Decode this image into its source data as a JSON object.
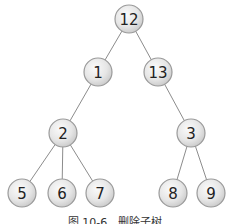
{
  "diagram": {
    "type": "tree",
    "nodes": [
      {
        "id": "n12",
        "label": "12",
        "x": 129,
        "y": 19
      },
      {
        "id": "n1",
        "label": "1",
        "x": 98,
        "y": 72
      },
      {
        "id": "n13",
        "label": "13",
        "x": 158,
        "y": 72
      },
      {
        "id": "n2",
        "label": "2",
        "x": 63,
        "y": 133
      },
      {
        "id": "n3",
        "label": "3",
        "x": 191,
        "y": 133
      },
      {
        "id": "n5",
        "label": "5",
        "x": 22,
        "y": 193
      },
      {
        "id": "n6",
        "label": "6",
        "x": 62,
        "y": 193
      },
      {
        "id": "n7",
        "label": "7",
        "x": 100,
        "y": 193
      },
      {
        "id": "n8",
        "label": "8",
        "x": 173,
        "y": 193
      },
      {
        "id": "n9",
        "label": "9",
        "x": 211,
        "y": 193
      }
    ],
    "edges": [
      [
        "n12",
        "n1"
      ],
      [
        "n12",
        "n13"
      ],
      [
        "n1",
        "n2"
      ],
      [
        "n13",
        "n3"
      ],
      [
        "n2",
        "n5"
      ],
      [
        "n2",
        "n6"
      ],
      [
        "n2",
        "n7"
      ],
      [
        "n3",
        "n8"
      ],
      [
        "n3",
        "n9"
      ]
    ],
    "node_radius": 14,
    "colors": {
      "node_fill_light": "#f4f4f4",
      "node_fill_dark": "#cfcfcf",
      "node_stroke": "#9a9a9a",
      "edge": "#8c8c8c"
    }
  },
  "caption": "图 10-6　删除子树"
}
